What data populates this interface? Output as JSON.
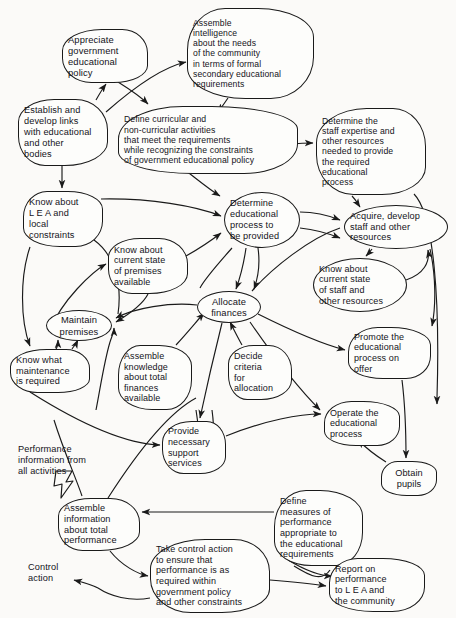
{
  "diagram": {
    "type": "cognitive-map",
    "background_color": "#fbfaf8",
    "line_color": "#1a1a1a",
    "text_color": "#14131a",
    "nodes": [
      {
        "id": "appreciate_policy",
        "label": "Appreciate\ngovernment\neducational\npolicy",
        "x": 62,
        "y": 29,
        "w": 86,
        "h": 54,
        "shape": "blobA",
        "font_size": 9.4,
        "align": "left"
      },
      {
        "id": "assemble_intelligence",
        "label": "Assemble\nintelligence\nabout the needs\nof the community\nin terms of formal\nsecondary educational\nrequirements",
        "x": 187,
        "y": 8,
        "w": 127,
        "h": 91,
        "shape": "blobB",
        "font_size": 8.6,
        "align": "left"
      },
      {
        "id": "establish_links",
        "label": "Establish and\ndevelop links\nwith educational\nand other\nbodies",
        "x": 18,
        "y": 99,
        "w": 90,
        "h": 67,
        "shape": "blobC",
        "font_size": 9.2,
        "align": "left"
      },
      {
        "id": "define_curricular",
        "label": "Define curricular and\nnon-curricular activities\nthat meet the requirements\nwhile recognizing the constraints\nof government educational policy",
        "x": 118,
        "y": 106,
        "w": 180,
        "h": 68,
        "shape": "blobD",
        "font_size": 8.7,
        "align": "left"
      },
      {
        "id": "determine_staff_expertise",
        "label": "Determine the\nstaff expertise and\nother resources\nneeded to provide\nthe required\neducational\nprocess",
        "x": 316,
        "y": 108,
        "w": 110,
        "h": 87,
        "shape": "blobA",
        "font_size": 8.7,
        "align": "left"
      },
      {
        "id": "know_lea",
        "label": "Know about\nL E A  and\nlocal\nconstraints",
        "x": 23,
        "y": 191,
        "w": 80,
        "h": 56,
        "shape": "blobB",
        "font_size": 9.2,
        "align": "left"
      },
      {
        "id": "determine_process",
        "label": "Determine\neducational\nprocess to\nbe provided",
        "x": 224,
        "y": 192,
        "w": 76,
        "h": 56,
        "shape": "pill",
        "font_size": 9.2,
        "align": "left"
      },
      {
        "id": "know_premises",
        "label": "Know about\ncurrent state\nof premises\navailable",
        "x": 108,
        "y": 238,
        "w": 80,
        "h": 56,
        "shape": "blobC",
        "font_size": 9.0,
        "align": "left"
      },
      {
        "id": "acquire_develop_staff",
        "label": "Acquire, develop\nstaff and other\nresources",
        "x": 344,
        "y": 205,
        "w": 104,
        "h": 44,
        "shape": "pill",
        "font_size": 9.2,
        "align": "left"
      },
      {
        "id": "know_staff_state",
        "label": "Know about\ncurrent state\nof staff and\nother resources",
        "x": 313,
        "y": 258,
        "w": 94,
        "h": 54,
        "shape": "pill",
        "font_size": 9.0,
        "align": "left"
      },
      {
        "id": "allocate_finances",
        "label": "Allocate\nfinances",
        "x": 197,
        "y": 291,
        "w": 64,
        "h": 32,
        "shape": "pill",
        "font_size": 9.4,
        "align": "center"
      },
      {
        "id": "maintain_premises",
        "label": "Maintain\npremises",
        "x": 46,
        "y": 310,
        "w": 66,
        "h": 31,
        "shape": "pill",
        "font_size": 9.4,
        "align": "center"
      },
      {
        "id": "promote_process",
        "label": "Promote the\neducational\nprocess on\noffer",
        "x": 348,
        "y": 327,
        "w": 83,
        "h": 52,
        "shape": "blobD",
        "font_size": 9.0,
        "align": "left"
      },
      {
        "id": "know_maintenance",
        "label": "Know what\nmaintenance\nis required",
        "x": 10,
        "y": 349,
        "w": 80,
        "h": 44,
        "shape": "blobA",
        "font_size": 9.2,
        "align": "left"
      },
      {
        "id": "assemble_knowledge_finances",
        "label": "Assemble\nknowledge\nabout total\nfinances\navailable",
        "x": 118,
        "y": 345,
        "w": 74,
        "h": 65,
        "shape": "blobB",
        "font_size": 9.0,
        "align": "left"
      },
      {
        "id": "decide_criteria",
        "label": "Decide\ncriteria\nfor\nallocation",
        "x": 228,
        "y": 345,
        "w": 64,
        "h": 55,
        "shape": "blobC",
        "font_size": 9.0,
        "align": "left"
      },
      {
        "id": "operate_process",
        "label": "Operate the\neducational\nprocess",
        "x": 324,
        "y": 401,
        "w": 76,
        "h": 45,
        "shape": "blobD",
        "font_size": 9.0,
        "align": "left"
      },
      {
        "id": "provide_support",
        "label": "Provide\nnecessary\nsupport\nservices",
        "x": 162,
        "y": 421,
        "w": 64,
        "h": 53,
        "shape": "blobA",
        "font_size": 9.0,
        "align": "left"
      },
      {
        "id": "obtain_pupils",
        "label": "Obtain\npupils",
        "x": 381,
        "y": 461,
        "w": 56,
        "h": 35,
        "shape": "blobB",
        "font_size": 9.2,
        "align": "center"
      },
      {
        "id": "assemble_info_performance",
        "label": "Assemble\ninformation\nabout total\nperformance",
        "x": 58,
        "y": 498,
        "w": 82,
        "h": 53,
        "shape": "blobC",
        "font_size": 9.2,
        "align": "left"
      },
      {
        "id": "define_measures",
        "label": "Define\nmeasures of\nperformance\nappropriate to\nthe educational\nrequirements",
        "x": 274,
        "y": 490,
        "w": 89,
        "h": 76,
        "shape": "blobD",
        "font_size": 9.0,
        "align": "left"
      },
      {
        "id": "take_control_action",
        "label": "Take control action\nto ensure that\nperformance is as\nrequired within\ngovernment policy\nand other constraints",
        "x": 150,
        "y": 539,
        "w": 120,
        "h": 74,
        "shape": "blobA",
        "font_size": 9.0,
        "align": "left"
      },
      {
        "id": "report_performance",
        "label": "Report on\nperformance\nto L E A and\nthe community",
        "x": 329,
        "y": 558,
        "w": 96,
        "h": 54,
        "shape": "blobB",
        "font_size": 9.0,
        "align": "left"
      }
    ],
    "free_labels": [
      {
        "id": "performance_info_label",
        "text": "Performance\ninformation from\nall activities",
        "x": 18,
        "y": 444,
        "font_size": 9.2
      },
      {
        "id": "control_action_label",
        "text": "Control\naction",
        "x": 28,
        "y": 562,
        "font_size": 9.2
      }
    ],
    "edges": [
      {
        "from": "establish_links",
        "to": "appreciate_policy"
      },
      {
        "from": "appreciate_policy",
        "to": "define_curricular"
      },
      {
        "from": "appreciate_policy",
        "to": "assemble_intelligence"
      },
      {
        "from": "assemble_intelligence",
        "to": "define_curricular"
      },
      {
        "from": "establish_links",
        "to": "know_lea"
      },
      {
        "from": "define_curricular",
        "to": "determine_staff_expertise"
      },
      {
        "from": "define_curricular",
        "to": "determine_process"
      },
      {
        "from": "know_lea",
        "to": "determine_process"
      },
      {
        "from": "know_premises",
        "to": "determine_process"
      },
      {
        "from": "determine_staff_expertise",
        "to": "acquire_develop_staff"
      },
      {
        "from": "determine_process",
        "to": "acquire_develop_staff"
      },
      {
        "from": "acquire_develop_staff",
        "to": "know_staff_state"
      },
      {
        "from": "know_staff_state",
        "to": "acquire_develop_staff"
      },
      {
        "from": "determine_process",
        "to": "allocate_finances"
      },
      {
        "from": "allocate_finances",
        "to": "maintain_premises"
      },
      {
        "from": "allocate_finances",
        "to": "acquire_develop_staff"
      },
      {
        "from": "allocate_finances",
        "to": "promote_process"
      },
      {
        "from": "allocate_finances",
        "to": "operate_process"
      },
      {
        "from": "allocate_finances",
        "to": "provide_support"
      },
      {
        "from": "assemble_knowledge_finances",
        "to": "allocate_finances"
      },
      {
        "from": "decide_criteria",
        "to": "allocate_finances"
      },
      {
        "from": "know_maintenance",
        "to": "maintain_premises"
      },
      {
        "from": "know_lea",
        "to": "know_maintenance"
      },
      {
        "from": "maintain_premises",
        "to": "know_premises"
      },
      {
        "from": "promote_process",
        "to": "obtain_pupils"
      },
      {
        "from": "obtain_pupils",
        "to": "operate_process"
      },
      {
        "from": "provide_support",
        "to": "operate_process"
      },
      {
        "from": "define_measures",
        "to": "assemble_info_performance"
      },
      {
        "from": "assemble_info_performance",
        "to": "take_control_action"
      },
      {
        "from": "take_control_action",
        "to": "report_performance"
      },
      {
        "from": "define_measures",
        "to": "report_performance"
      },
      {
        "from": "take_control_action",
        "to": "control_action_label"
      },
      {
        "from": "performance_info_label",
        "to": "assemble_info_performance"
      }
    ]
  }
}
